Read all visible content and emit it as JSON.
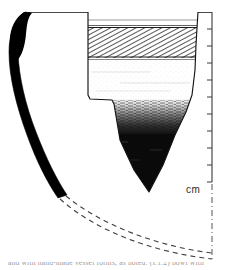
{
  "figure": {
    "name": "archaeological-pottery-profile-drawing",
    "background_color": "#ffffff",
    "ink_color": "#000000"
  },
  "scale": {
    "unit_label": "cm",
    "tick_count": 10,
    "axis_x": 212,
    "axis_top_y": 12,
    "axis_bottom_y": 182,
    "tick_spacing_px": 17,
    "tick_length_px": 5,
    "line_color": "#3a3a3a"
  },
  "centerline": {
    "name": "vessel-axis-dash-dot",
    "x": 212,
    "top_y": 184,
    "bottom_y": 258,
    "color": "#5a5a5a",
    "dash_pattern": "6,3,1,3"
  },
  "rim_line": {
    "name": "rim-level-line",
    "x1": 28,
    "x2": 212,
    "y": 12,
    "color": "#4a4a4a"
  },
  "profile_section": {
    "name": "vessel-wall-solid-section",
    "description": "Thick solid black curved wall cross-section on the left",
    "fill": "#000000",
    "top_x": 30,
    "top_y": 13,
    "bottom_x": 67,
    "bottom_y": 196
  },
  "reconstruction": {
    "name": "reconstructed-base-dashed-curves",
    "curve_count": 2,
    "color": "#4a4a4a",
    "dash_pattern": "5,4",
    "start_x": 66,
    "start_y": 195,
    "end_x": 212,
    "end_y": 254
  },
  "sherd": {
    "name": "decorated-sherd-elevation",
    "left_x": 88,
    "right_x": 198,
    "top_y": 12,
    "tip_x": 150,
    "tip_y": 192,
    "outline_color": "#1a1a1a",
    "bands": [
      {
        "name": "plain-rim-band",
        "label": "plain rim band",
        "top_y": 12,
        "bottom_y": 27,
        "fill": "#ffffff",
        "texture": "none"
      },
      {
        "name": "hatched-decoration-band",
        "label": "diagonal hatched decoration band",
        "top_y": 27,
        "bottom_y": 58,
        "fill": "#ffffff",
        "texture": "diagonal-hatch",
        "hatch_angle_deg": 62,
        "hatch_spacing_px": 2.2
      },
      {
        "name": "light-stipple-body-band",
        "label": "light stippled body band",
        "top_y": 58,
        "bottom_y": 100,
        "fill": "#ffffff",
        "texture": "fine-stipple"
      },
      {
        "name": "gradient-transition-band",
        "label": "graded dark wash transition",
        "top_y": 100,
        "bottom_y": 132,
        "fill": "#ffffff",
        "texture": "gradient-dark"
      },
      {
        "name": "solid-dark-slip-band",
        "label": "solid dark slipped lower body",
        "top_y": 132,
        "bottom_y": 192,
        "fill": "#0a0a0a",
        "texture": "solid"
      }
    ],
    "shoulder_step": {
      "name": "left-shoulder-step",
      "x_from": 88,
      "x_to": 112,
      "y": 99
    }
  },
  "caption": {
    "name": "cropped-caption-text",
    "text": "and with hand-made vessel forms, as noted. (I.1.2) bowl with",
    "visible": "partially cropped at bottom edge"
  }
}
